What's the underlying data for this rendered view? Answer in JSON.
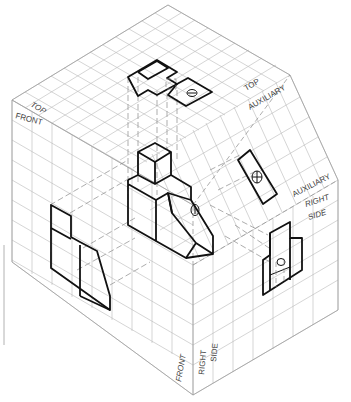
{
  "figure": {
    "type": "isometric glass-box projection diagram",
    "planes": {
      "top": "TOP",
      "front": "FRONT",
      "top_auxiliary": [
        "TOP",
        "AUXILIARY"
      ],
      "auxiliary_right_side": [
        "AUXILIARY",
        "RIGHT",
        "SIDE"
      ],
      "front_right_edge": [
        "FRONT",
        "RIGHT",
        "SIDE"
      ]
    },
    "labels": {
      "top_left": "TOP",
      "front_left": "FRONT",
      "top_aux_1": "TOP",
      "top_aux_2": "AUXILIARY",
      "aux_rs_1": "AUXILIARY",
      "aux_rs_2": "RIGHT",
      "aux_rs_3": "SIDE",
      "bottom_front": "FRONT",
      "bottom_right": "RIGHT",
      "bottom_side": "SIDE"
    },
    "colors": {
      "grid": "#b8b8b8",
      "object_lines": "#111111",
      "projection_lines": "#8a8a8a",
      "background": "#ffffff"
    }
  }
}
